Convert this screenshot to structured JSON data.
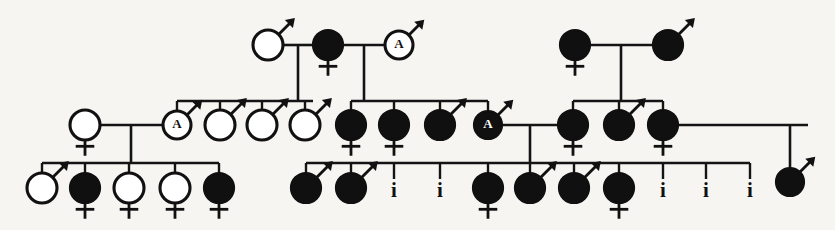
{
  "figure": {
    "width": 835,
    "height": 230,
    "background_color": "#f6f5f2",
    "ink_color": "#111111"
  },
  "legend": {
    "open_circle": "unaffected individual",
    "filled_circle": "affected individual",
    "male_symbol": "male (arrow)",
    "female_symbol": "female (cross)",
    "letter_a": "A",
    "infant_label": "i"
  },
  "individuals": [
    {
      "id": "I-1",
      "label": "",
      "sex": "male",
      "affected": false,
      "x": 268,
      "y": 45,
      "r": 15
    },
    {
      "id": "I-2",
      "label": "",
      "sex": "female",
      "affected": true,
      "x": 328,
      "y": 45,
      "r": 15
    },
    {
      "id": "I-3",
      "label": "A",
      "sex": "male",
      "affected": false,
      "x": 399,
      "y": 45,
      "r": 14
    },
    {
      "id": "I-4",
      "label": "",
      "sex": "female",
      "affected": true,
      "x": 575,
      "y": 45,
      "r": 15
    },
    {
      "id": "I-5",
      "label": "",
      "sex": "male",
      "affected": true,
      "x": 668,
      "y": 45,
      "r": 15
    },
    {
      "id": "II-1",
      "label": "",
      "sex": "female",
      "affected": false,
      "x": 85,
      "y": 125,
      "r": 15
    },
    {
      "id": "II-2",
      "label": "A",
      "sex": "male",
      "affected": false,
      "x": 177,
      "y": 125,
      "r": 14
    },
    {
      "id": "II-3",
      "label": "",
      "sex": "male",
      "affected": false,
      "x": 220,
      "y": 125,
      "r": 15
    },
    {
      "id": "II-4",
      "label": "",
      "sex": "male",
      "affected": false,
      "x": 262,
      "y": 125,
      "r": 15
    },
    {
      "id": "II-5",
      "label": "",
      "sex": "male",
      "affected": false,
      "x": 305,
      "y": 125,
      "r": 15
    },
    {
      "id": "II-6",
      "label": "",
      "sex": "female",
      "affected": true,
      "x": 351,
      "y": 125,
      "r": 15
    },
    {
      "id": "II-7",
      "label": "",
      "sex": "female",
      "affected": true,
      "x": 394,
      "y": 125,
      "r": 15
    },
    {
      "id": "II-8",
      "label": "",
      "sex": "male",
      "affected": true,
      "x": 440,
      "y": 125,
      "r": 15
    },
    {
      "id": "II-9",
      "label": "A",
      "sex": "male",
      "affected": true,
      "x": 488,
      "y": 125,
      "r": 14
    },
    {
      "id": "II-10",
      "label": "",
      "sex": "female",
      "affected": true,
      "x": 573,
      "y": 125,
      "r": 15
    },
    {
      "id": "II-11",
      "label": "",
      "sex": "male",
      "affected": true,
      "x": 619,
      "y": 125,
      "r": 15
    },
    {
      "id": "II-12",
      "label": "",
      "sex": "female",
      "affected": true,
      "x": 663,
      "y": 125,
      "r": 15
    },
    {
      "id": "III-1",
      "label": "",
      "sex": "male",
      "affected": false,
      "x": 42,
      "y": 188,
      "r": 15
    },
    {
      "id": "III-2",
      "label": "",
      "sex": "female",
      "affected": true,
      "x": 85,
      "y": 188,
      "r": 15
    },
    {
      "id": "III-3",
      "label": "",
      "sex": "female",
      "affected": false,
      "x": 129,
      "y": 188,
      "r": 15
    },
    {
      "id": "III-4",
      "label": "",
      "sex": "female",
      "affected": false,
      "x": 175,
      "y": 188,
      "r": 15
    },
    {
      "id": "III-5",
      "label": "",
      "sex": "female",
      "affected": true,
      "x": 219,
      "y": 188,
      "r": 15
    },
    {
      "id": "III-6",
      "label": "",
      "sex": "male",
      "affected": true,
      "x": 306,
      "y": 188,
      "r": 15
    },
    {
      "id": "III-7",
      "label": "",
      "sex": "male",
      "affected": true,
      "x": 351,
      "y": 188,
      "r": 15
    },
    {
      "id": "III-8",
      "label": "i",
      "sex": "infant",
      "affected": false,
      "x": 394,
      "y": 190,
      "r": 0
    },
    {
      "id": "III-9",
      "label": "i",
      "sex": "infant",
      "affected": false,
      "x": 440,
      "y": 190,
      "r": 0
    },
    {
      "id": "III-10",
      "label": "",
      "sex": "female",
      "affected": true,
      "x": 488,
      "y": 188,
      "r": 15
    },
    {
      "id": "III-11",
      "label": "",
      "sex": "male",
      "affected": true,
      "x": 530,
      "y": 188,
      "r": 15
    },
    {
      "id": "III-12",
      "label": "",
      "sex": "male",
      "affected": true,
      "x": 574,
      "y": 188,
      "r": 15
    },
    {
      "id": "III-13",
      "label": "",
      "sex": "female",
      "affected": true,
      "x": 619,
      "y": 188,
      "r": 15
    },
    {
      "id": "III-14",
      "label": "i",
      "sex": "infant",
      "affected": false,
      "x": 663,
      "y": 190,
      "r": 0
    },
    {
      "id": "III-15",
      "label": "i",
      "sex": "infant",
      "affected": false,
      "x": 706,
      "y": 190,
      "r": 0
    },
    {
      "id": "III-16",
      "label": "i",
      "sex": "infant",
      "affected": false,
      "x": 750,
      "y": 190,
      "r": 0
    },
    {
      "id": "III-17",
      "label": "",
      "sex": "male",
      "affected": true,
      "x": 790,
      "y": 182,
      "r": 14
    }
  ],
  "counts": {
    "generations": 3,
    "total_individuals": 33,
    "affected": 21,
    "unaffected": 9,
    "infant_deaths": 5,
    "letter_a_individuals": 3
  }
}
